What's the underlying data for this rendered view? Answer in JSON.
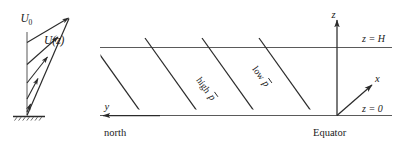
{
  "figure": {
    "background_color": "#ffffff",
    "line_color": "#2b2b2b",
    "text_color": "#1a1a1a",
    "width": 405,
    "height": 149
  },
  "left_panel": {
    "name": "velocity-profile",
    "description": "Vertical wind profile with arrows increasing with height above a hatched ground surface",
    "labels": {
      "u_zero": "U",
      "u_zero_sub": "0",
      "u_of_z": "U(z)"
    },
    "arrow_count": 5
  },
  "right_panel": {
    "name": "domain-box",
    "labels": {
      "z_axis": "z",
      "x_axis": "x",
      "y_axis": "y",
      "z_top": "z = H",
      "z_bottom": "z = 0",
      "equator": "Equator",
      "north": "north",
      "high_pressure": "high p̄",
      "high_pressure_text": "high",
      "high_pressure_symbol": "p",
      "low_pressure": "low p̄",
      "low_pressure_text": "low",
      "low_pressure_symbol": "p"
    },
    "isobar_count": 4
  }
}
